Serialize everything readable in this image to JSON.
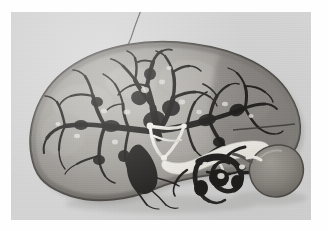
{
  "figure": {
    "kind": "photograph",
    "modality": "grayscale-anatomical-photograph",
    "caption_text": "",
    "frame": {
      "outer_width": 328,
      "outer_height": 231,
      "border_color": "#fefefe",
      "plate_x": 11,
      "plate_y": 12,
      "plate_width": 300,
      "plate_height": 208
    },
    "palette": {
      "background_grey": "#d5d5d5",
      "parenchyma_light": "#b4b1ac",
      "parenchyma_mid": "#9a9691",
      "parenchyma_dark": "#7d7974",
      "capsule_outline": "#4e4b47",
      "vascular_tree_dark": "#2d2b28",
      "vascular_tree_darkest": "#191816",
      "duct_white": "#f2f0ea",
      "duct_highlight": "#fdfcf8",
      "gallbladder_grey": "#8e8a84",
      "suture_thread": "#5a5753"
    },
    "structures": [
      {
        "id": "suture-thread",
        "label": "suture thread",
        "region": "top-centre"
      },
      {
        "id": "liver-capsule",
        "label": "liver capsule / outline",
        "region": "whole"
      },
      {
        "id": "hepatic-parenchyma",
        "label": "hepatic parenchyma (cut surface)",
        "region": "whole"
      },
      {
        "id": "intrahepatic-tree",
        "label": "intrahepatic vascular / biliary tree",
        "region": "centre-upper"
      },
      {
        "id": "left-branch-tree",
        "label": "left lobe branch tree",
        "region": "left"
      },
      {
        "id": "right-branch-tree",
        "label": "right lobe branch tree",
        "region": "right-upper"
      },
      {
        "id": "hilar-duct-triangle",
        "label": "hilar duct triangle (white cast)",
        "region": "centre"
      },
      {
        "id": "common-bile-duct",
        "label": "common bile duct (white cast)",
        "region": "centre-right"
      },
      {
        "id": "cystic-duct",
        "label": "cystic duct",
        "region": "centre-right"
      },
      {
        "id": "gallbladder",
        "label": "gallbladder",
        "region": "right-lower"
      },
      {
        "id": "portal-vessels",
        "label": "portal vessels at hilum",
        "region": "centre-lower"
      },
      {
        "id": "inferior-vessels",
        "label": "inferior vascular branches",
        "region": "bottom-centre"
      }
    ]
  }
}
